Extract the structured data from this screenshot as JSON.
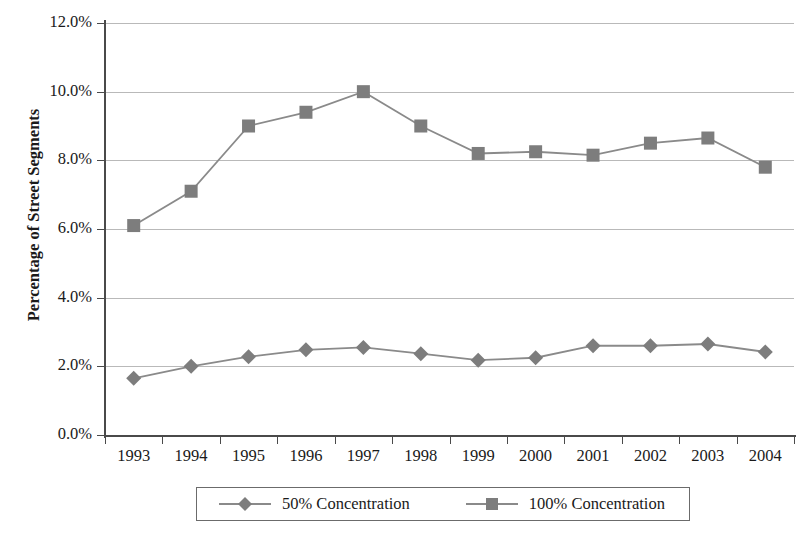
{
  "chart_data": {
    "type": "line",
    "title": "",
    "xlabel": "",
    "ylabel": "Percentage of Street Segments",
    "categories": [
      "1993",
      "1994",
      "1995",
      "1996",
      "1997",
      "1998",
      "1999",
      "2000",
      "2001",
      "2002",
      "2003",
      "2004"
    ],
    "ylim": [
      0,
      12
    ],
    "ytick_values": [
      0,
      2,
      4,
      6,
      8,
      10,
      12
    ],
    "ytick_labels": [
      "0.0%",
      "2.0%",
      "4.0%",
      "6.0%",
      "8.0%",
      "10.0%",
      "12.0%"
    ],
    "grid": "horizontal",
    "legend_position": "bottom",
    "series": [
      {
        "name": "50% Concentration",
        "marker": "diamond",
        "color": "#7d7d7d",
        "line_color": "#8a8a8a",
        "values": [
          1.65,
          2.0,
          2.28,
          2.48,
          2.55,
          2.37,
          2.18,
          2.25,
          2.6,
          2.6,
          2.65,
          2.42
        ]
      },
      {
        "name": "100% Concentration",
        "marker": "square",
        "color": "#7d7d7d",
        "line_color": "#8a8a8a",
        "values": [
          6.1,
          7.1,
          9.0,
          9.4,
          10.0,
          9.0,
          8.2,
          8.25,
          8.15,
          8.5,
          8.65,
          7.8
        ]
      }
    ]
  },
  "axes": {
    "y_title": "Percentage of Street Segments"
  },
  "legend": {
    "entries": [
      {
        "label": "50% Concentration",
        "marker": "diamond-marker-icon"
      },
      {
        "label": "100% Concentration",
        "marker": "square-marker-icon"
      }
    ]
  },
  "style": {
    "grid_color": "#b9b9b9",
    "axis_color": "#4a4a4a",
    "series_color": "#7d7d7d",
    "background": "#ffffff"
  }
}
